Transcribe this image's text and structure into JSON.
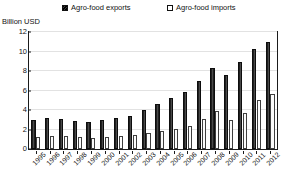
{
  "legend": {
    "entries": [
      {
        "label": "Agro-food exports",
        "marker": "filled-square-icon",
        "color": "#202020"
      },
      {
        "label": "Agro-food imports",
        "marker": "hollow-square-icon",
        "color": "#ffffff"
      }
    ]
  },
  "axis_title": "Billion USD",
  "chart_data": {
    "type": "bar",
    "title": "",
    "subtitle": "",
    "xlabel": "",
    "ylabel": "Billion USD",
    "ylim": [
      0,
      12
    ],
    "yticks": [
      0,
      2,
      4,
      6,
      8,
      10,
      12
    ],
    "grid": true,
    "legend_position": "top",
    "categories": [
      "1995",
      "1996",
      "1997",
      "1998",
      "1999",
      "2000",
      "2001",
      "2002",
      "2003",
      "2004",
      "2005",
      "2006",
      "2007",
      "2008",
      "2009",
      "2010",
      "2011",
      "2012"
    ],
    "series": [
      {
        "name": "Agro-food exports",
        "values": [
          3.0,
          3.2,
          3.1,
          2.9,
          2.8,
          3.0,
          3.2,
          3.4,
          4.0,
          4.6,
          5.2,
          5.8,
          7.0,
          8.3,
          7.6,
          8.9,
          10.3,
          11.0
        ]
      },
      {
        "name": "Agro-food imports",
        "values": [
          1.2,
          1.3,
          1.3,
          1.2,
          1.1,
          1.2,
          1.3,
          1.4,
          1.6,
          1.8,
          2.1,
          2.4,
          3.1,
          3.9,
          3.0,
          3.7,
          5.0,
          5.6
        ]
      }
    ]
  }
}
